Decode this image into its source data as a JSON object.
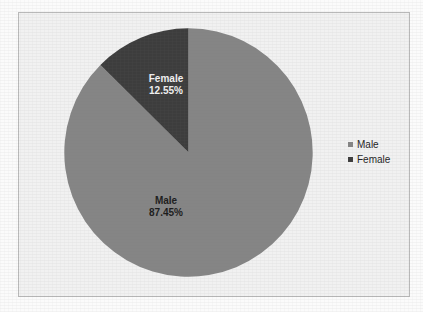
{
  "chart_data": {
    "type": "pie",
    "title": "",
    "categories": [
      "Male",
      "Female"
    ],
    "values": [
      87.45,
      12.55
    ],
    "labels": [
      "87.45%",
      "12.55%"
    ],
    "unit": "%",
    "legend_position": "right",
    "grid": false,
    "start_angle_deg": 0,
    "direction": "counterclockwise",
    "slices": [
      {
        "name": "Male",
        "value": 87.45,
        "value_text": "87.45%",
        "color": "#858585",
        "label_color": "#1c1c1c"
      },
      {
        "name": "Female",
        "value": 12.55,
        "value_text": "12.55%",
        "color": "#3d3d3d",
        "label_color": "#f2f2f2"
      }
    ]
  },
  "legend": {
    "items": [
      {
        "label": "Male",
        "swatch_color": "#858585"
      },
      {
        "label": "Female",
        "swatch_color": "#3d3d3d"
      }
    ]
  },
  "colors": {
    "page_background": "#fbfbfb",
    "chart_background": "#f1f1f1",
    "frame_border": "#b9b9b9",
    "male": "#858585",
    "female": "#3d3d3d"
  },
  "ghost": {
    "top": "",
    "bottom": ""
  }
}
